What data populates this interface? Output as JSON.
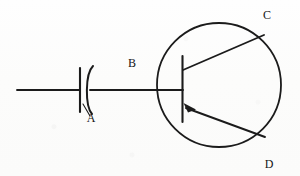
{
  "diagram": {
    "background_color": "#fdfdfc",
    "ink_color": "#1b1b1b",
    "width": 300,
    "height": 176,
    "labels": [
      {
        "id": "A",
        "text": "A",
        "refers_to": "capacitor",
        "x": 91,
        "y": 121
      },
      {
        "id": "B",
        "text": "B",
        "refers_to": "base-lead",
        "x": 132,
        "y": 67
      },
      {
        "id": "C",
        "text": "C",
        "refers_to": "collector-lead",
        "x": 266,
        "y": 18
      },
      {
        "id": "D",
        "text": "D",
        "refers_to": "emitter-lead",
        "x": 268,
        "y": 169
      }
    ],
    "components": {
      "capacitor": {
        "name": "capacitor",
        "symbol": "capacitor-polarized",
        "plate_x": 80,
        "curve_x": 88,
        "plate_top": 68,
        "plate_bottom": 112
      },
      "transistor": {
        "name": "pnp-transistor",
        "symbol": "transistor-pnp",
        "circle_cx": 219,
        "circle_cy": 85,
        "circle_r": 62,
        "base_bar_x": 182,
        "base_bar_top": 56,
        "base_bar_bottom": 122,
        "arrow_direction": "toward-base"
      },
      "input_wire": {
        "name": "input-wire",
        "x_start": 17,
        "x_end": 80,
        "y": 90
      },
      "base_wire": {
        "name": "base-wire",
        "x_start": 88,
        "x_end": 182,
        "y": 90
      },
      "collector_lead": {
        "name": "collector-lead",
        "x1": 183,
        "y1": 70,
        "x2": 264,
        "y2": 35
      },
      "emitter_lead": {
        "name": "emitter-lead",
        "x1": 184,
        "y1": 108,
        "x2": 265,
        "y2": 137
      },
      "leader_line_a": {
        "name": "label-a-leader",
        "x1": 83,
        "y1": 104,
        "x2": 90,
        "y2": 115
      }
    }
  }
}
